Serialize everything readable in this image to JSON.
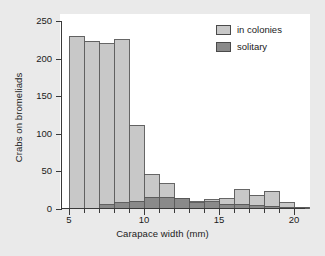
{
  "figure": {
    "background_color": "#eaeaea",
    "plot_background_color": "#ffffff"
  },
  "legend": {
    "position": "top-right",
    "entries": [
      {
        "label": "in colonies",
        "color": "#c8c8c8",
        "swatch_name": "legend-swatch-in-colonies"
      },
      {
        "label": "solitary",
        "color": "#8a8a8a",
        "swatch_name": "legend-swatch-solitary"
      }
    ]
  },
  "chart_data": {
    "type": "bar",
    "title": "",
    "xlabel": "Carapace width (mm)",
    "ylabel": "Crabs on bromeliads",
    "xlim": [
      4,
      21
    ],
    "ylim": [
      0,
      250
    ],
    "xticks": [
      5,
      10,
      15,
      20
    ],
    "xtick_labels": [
      "5",
      "10",
      "15",
      "20"
    ],
    "xminor_ticks": [
      6,
      7,
      8,
      9,
      11,
      12,
      13,
      14,
      16,
      17,
      18,
      19
    ],
    "yticks": [
      0,
      50,
      100,
      150,
      200,
      250
    ],
    "ytick_labels": [
      "0",
      "50",
      "100",
      "150",
      "200",
      "250"
    ],
    "grid": false,
    "legend_position": "top-right",
    "bin_edges": [
      5,
      6,
      7,
      8,
      9,
      10,
      11,
      12,
      13,
      14,
      15,
      16,
      17,
      18,
      19,
      20,
      21
    ],
    "bin_centers": [
      5.5,
      6.5,
      7.5,
      8.5,
      9.5,
      10.5,
      11.5,
      12.5,
      13.5,
      14.5,
      15.5,
      16.5,
      17.5,
      18.5,
      19.5,
      20.5
    ],
    "series": [
      {
        "name": "in colonies",
        "color": "#c8c8c8",
        "edge_color": "#555555",
        "values": [
          230,
          223,
          220,
          225,
          111,
          45,
          33,
          13,
          9,
          12,
          13,
          25,
          18,
          23,
          8,
          0
        ]
      },
      {
        "name": "solitary",
        "color": "#8a8a8a",
        "edge_color": "#555555",
        "values": [
          0,
          0,
          5,
          8,
          10,
          15,
          15,
          13,
          8,
          9,
          6,
          6,
          4,
          3,
          2,
          2
        ]
      }
    ]
  }
}
